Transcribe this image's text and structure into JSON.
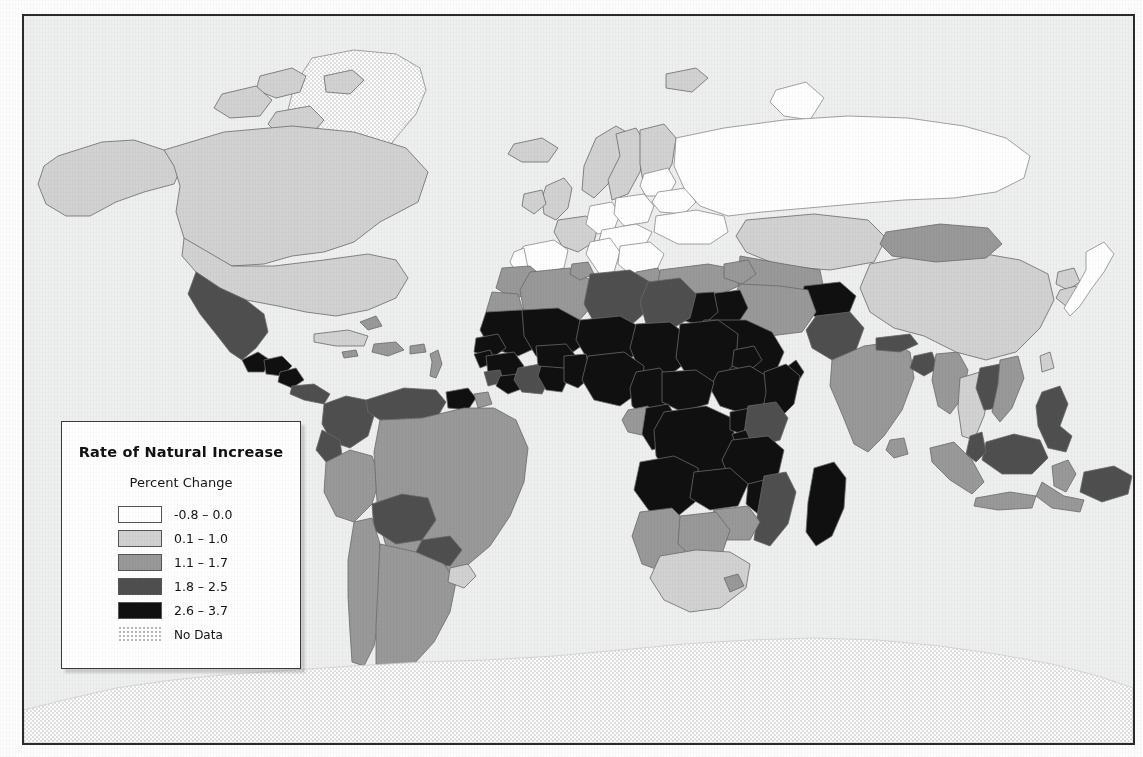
{
  "map": {
    "frame": {
      "x": 22,
      "y": 14,
      "width": 1113,
      "height": 731
    },
    "ocean_color": "#eef0ef",
    "border_color": "#2b2b2b",
    "country_outline_color": "#6a6a6a"
  },
  "legend": {
    "title": "Rate of Natural Increase",
    "subtitle": "Percent Change",
    "items": [
      {
        "label": "-0.8 – 0.0",
        "color": "#ffffff",
        "kind": "solid",
        "min": -0.8,
        "max": 0.0
      },
      {
        "label": "0.1 – 1.0",
        "color": "#d2d2d2",
        "kind": "solid",
        "min": 0.1,
        "max": 1.0
      },
      {
        "label": "1.1 – 1.7",
        "color": "#999999",
        "kind": "solid",
        "min": 1.1,
        "max": 1.7
      },
      {
        "label": "1.8 – 2.5",
        "color": "#4f4f4f",
        "kind": "solid",
        "min": 1.8,
        "max": 2.5
      },
      {
        "label": "2.6 – 3.7",
        "color": "#101010",
        "kind": "solid",
        "min": 2.6,
        "max": 3.7
      },
      {
        "label": "No Data",
        "color": "#ffffff",
        "kind": "stipple",
        "min": null,
        "max": null
      }
    ]
  },
  "chart_data": {
    "type": "choropleth-map",
    "title": "Rate of Natural Increase",
    "subtitle": "Percent Change",
    "value_unit": "percent",
    "projection": "equirectangular-like world map",
    "classes": [
      {
        "label": "-0.8 – 0.0",
        "color": "#ffffff",
        "min": -0.8,
        "max": 0.0
      },
      {
        "label": "0.1 – 1.0",
        "color": "#d2d2d2",
        "min": 0.1,
        "max": 1.0
      },
      {
        "label": "1.1 – 1.7",
        "color": "#999999",
        "min": 1.1,
        "max": 1.7
      },
      {
        "label": "1.8 – 2.5",
        "color": "#4f4f4f",
        "min": 1.8,
        "max": 2.5
      },
      {
        "label": "2.6 – 3.7",
        "color": "#101010",
        "min": 2.6,
        "max": 3.7
      },
      {
        "label": "No Data",
        "color": "stipple",
        "min": null,
        "max": null
      }
    ],
    "regions": [
      {
        "name": "Canada",
        "class": "0.1 – 1.0"
      },
      {
        "name": "United States",
        "class": "0.1 – 1.0"
      },
      {
        "name": "Alaska",
        "class": "0.1 – 1.0"
      },
      {
        "name": "Greenland",
        "class": "No Data"
      },
      {
        "name": "Mexico",
        "class": "1.8 – 2.5"
      },
      {
        "name": "Guatemala",
        "class": "2.6 – 3.7"
      },
      {
        "name": "Honduras",
        "class": "2.6 – 3.7"
      },
      {
        "name": "Nicaragua",
        "class": "2.6 – 3.7"
      },
      {
        "name": "Costa Rica",
        "class": "1.8 – 2.5"
      },
      {
        "name": "Panama",
        "class": "1.8 – 2.5"
      },
      {
        "name": "Cuba",
        "class": "0.1 – 1.0"
      },
      {
        "name": "Caribbean Isles",
        "class": "1.1 – 1.7"
      },
      {
        "name": "Colombia",
        "class": "1.8 – 2.5"
      },
      {
        "name": "Venezuela",
        "class": "1.8 – 2.5"
      },
      {
        "name": "Guyana",
        "class": "2.6 – 3.7"
      },
      {
        "name": "Ecuador",
        "class": "1.8 – 2.5"
      },
      {
        "name": "Peru",
        "class": "1.1 – 1.7"
      },
      {
        "name": "Bolivia",
        "class": "1.8 – 2.5"
      },
      {
        "name": "Brazil",
        "class": "1.1 – 1.7"
      },
      {
        "name": "Paraguay",
        "class": "1.8 – 2.5"
      },
      {
        "name": "Chile",
        "class": "1.1 – 1.7"
      },
      {
        "name": "Argentina",
        "class": "1.1 – 1.7"
      },
      {
        "name": "Uruguay",
        "class": "0.1 – 1.0"
      },
      {
        "name": "Iceland",
        "class": "0.1 – 1.0"
      },
      {
        "name": "Norway",
        "class": "0.1 – 1.0"
      },
      {
        "name": "Sweden",
        "class": "0.1 – 1.0"
      },
      {
        "name": "Finland",
        "class": "0.1 – 1.0"
      },
      {
        "name": "United Kingdom",
        "class": "0.1 – 1.0"
      },
      {
        "name": "Ireland",
        "class": "0.1 – 1.0"
      },
      {
        "name": "France",
        "class": "0.1 – 1.0"
      },
      {
        "name": "Spain",
        "class": "-0.8 – 0.0"
      },
      {
        "name": "Portugal",
        "class": "-0.8 – 0.0"
      },
      {
        "name": "Germany",
        "class": "-0.8 – 0.0"
      },
      {
        "name": "Poland",
        "class": "-0.8 – 0.0"
      },
      {
        "name": "Italy",
        "class": "-0.8 – 0.0"
      },
      {
        "name": "Greece",
        "class": "-0.8 – 0.0"
      },
      {
        "name": "Balkans",
        "class": "-0.8 – 0.0"
      },
      {
        "name": "Ukraine",
        "class": "-0.8 – 0.0"
      },
      {
        "name": "Belarus",
        "class": "-0.8 – 0.0"
      },
      {
        "name": "Russia",
        "class": "-0.8 – 0.0"
      },
      {
        "name": "Baltic States",
        "class": "-0.8 – 0.0"
      },
      {
        "name": "Turkey",
        "class": "1.1 – 1.7"
      },
      {
        "name": "Kazakhstan",
        "class": "0.1 – 1.0"
      },
      {
        "name": "Uzbekistan",
        "class": "1.1 – 1.7"
      },
      {
        "name": "Turkmenistan",
        "class": "1.1 – 1.7"
      },
      {
        "name": "Afghanistan",
        "class": "2.6 – 3.7"
      },
      {
        "name": "Iran",
        "class": "1.1 – 1.7"
      },
      {
        "name": "Iraq",
        "class": "2.6 – 3.7"
      },
      {
        "name": "Syria",
        "class": "2.6 – 3.7"
      },
      {
        "name": "Saudi Arabia",
        "class": "2.6 – 3.7"
      },
      {
        "name": "Yemen",
        "class": "2.6 – 3.7"
      },
      {
        "name": "Oman",
        "class": "2.6 – 3.7"
      },
      {
        "name": "Pakistan",
        "class": "1.8 – 2.5"
      },
      {
        "name": "India",
        "class": "1.1 – 1.7"
      },
      {
        "name": "Nepal",
        "class": "1.8 – 2.5"
      },
      {
        "name": "Bangladesh",
        "class": "1.8 – 2.5"
      },
      {
        "name": "Myanmar",
        "class": "1.1 – 1.7"
      },
      {
        "name": "Thailand",
        "class": "0.1 – 1.0"
      },
      {
        "name": "Vietnam",
        "class": "1.1 – 1.7"
      },
      {
        "name": "Laos",
        "class": "1.8 – 2.5"
      },
      {
        "name": "Cambodia",
        "class": "1.8 – 2.5"
      },
      {
        "name": "China",
        "class": "0.1 – 1.0"
      },
      {
        "name": "Mongolia",
        "class": "1.1 – 1.7"
      },
      {
        "name": "Japan",
        "class": "-0.8 – 0.0"
      },
      {
        "name": "South Korea",
        "class": "0.1 – 1.0"
      },
      {
        "name": "North Korea",
        "class": "0.1 – 1.0"
      },
      {
        "name": "Philippines",
        "class": "1.8 – 2.5"
      },
      {
        "name": "Malaysia",
        "class": "1.8 – 2.5"
      },
      {
        "name": "Indonesia",
        "class": "1.1 – 1.7"
      },
      {
        "name": "Papua New Guinea",
        "class": "1.8 – 2.5"
      },
      {
        "name": "Australia",
        "class": "0.1 – 1.0"
      },
      {
        "name": "New Zealand",
        "class": "0.1 – 1.0"
      },
      {
        "name": "Morocco",
        "class": "1.1 – 1.7"
      },
      {
        "name": "Algeria",
        "class": "1.1 – 1.7"
      },
      {
        "name": "Tunisia",
        "class": "1.1 – 1.7"
      },
      {
        "name": "Libya",
        "class": "1.8 – 2.5"
      },
      {
        "name": "Egypt",
        "class": "1.8 – 2.5"
      },
      {
        "name": "Western Sahara",
        "class": "1.1 – 1.7"
      },
      {
        "name": "Mauritania",
        "class": "2.6 – 3.7"
      },
      {
        "name": "Mali",
        "class": "2.6 – 3.7"
      },
      {
        "name": "Niger",
        "class": "2.6 – 3.7"
      },
      {
        "name": "Chad",
        "class": "2.6 – 3.7"
      },
      {
        "name": "Sudan",
        "class": "2.6 – 3.7"
      },
      {
        "name": "Eritrea",
        "class": "2.6 – 3.7"
      },
      {
        "name": "Ethiopia",
        "class": "2.6 – 3.7"
      },
      {
        "name": "Somalia",
        "class": "2.6 – 3.7"
      },
      {
        "name": "Senegal",
        "class": "2.6 – 3.7"
      },
      {
        "name": "Guinea",
        "class": "2.6 – 3.7"
      },
      {
        "name": "Sierra Leone",
        "class": "1.8 – 2.5"
      },
      {
        "name": "Liberia",
        "class": "2.6 – 3.7"
      },
      {
        "name": "Ivory Coast",
        "class": "1.8 – 2.5"
      },
      {
        "name": "Ghana",
        "class": "2.6 – 3.7"
      },
      {
        "name": "Burkina Faso",
        "class": "2.6 – 3.7"
      },
      {
        "name": "Benin",
        "class": "2.6 – 3.7"
      },
      {
        "name": "Togo",
        "class": "2.6 – 3.7"
      },
      {
        "name": "Nigeria",
        "class": "2.6 – 3.7"
      },
      {
        "name": "Cameroon",
        "class": "2.6 – 3.7"
      },
      {
        "name": "Central African Republic",
        "class": "2.6 – 3.7"
      },
      {
        "name": "Gabon",
        "class": "1.1 – 1.7"
      },
      {
        "name": "Congo",
        "class": "2.6 – 3.7"
      },
      {
        "name": "DR Congo",
        "class": "2.6 – 3.7"
      },
      {
        "name": "Uganda",
        "class": "2.6 – 3.7"
      },
      {
        "name": "Kenya",
        "class": "1.8 – 2.5"
      },
      {
        "name": "Tanzania",
        "class": "2.6 – 3.7"
      },
      {
        "name": "Rwanda",
        "class": "2.6 – 3.7"
      },
      {
        "name": "Burundi",
        "class": "2.6 – 3.7"
      },
      {
        "name": "Angola",
        "class": "2.6 – 3.7"
      },
      {
        "name": "Zambia",
        "class": "2.6 – 3.7"
      },
      {
        "name": "Malawi",
        "class": "2.6 – 3.7"
      },
      {
        "name": "Mozambique",
        "class": "1.8 – 2.5"
      },
      {
        "name": "Zimbabwe",
        "class": "1.1 – 1.7"
      },
      {
        "name": "Namibia",
        "class": "1.1 – 1.7"
      },
      {
        "name": "Botswana",
        "class": "1.1 – 1.7"
      },
      {
        "name": "South Africa",
        "class": "0.1 – 1.0"
      },
      {
        "name": "Lesotho",
        "class": "0.1 – 1.0"
      },
      {
        "name": "Madagascar",
        "class": "2.6 – 3.7"
      },
      {
        "name": "Antarctica",
        "class": "No Data"
      }
    ]
  }
}
